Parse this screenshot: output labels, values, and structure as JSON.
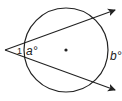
{
  "diagram": {
    "type": "secant-angle-circle",
    "labels": {
      "angle_inner_arc": "a°",
      "angle_outer_arc": "b°",
      "angle_mark": "1"
    },
    "colors": {
      "stroke": "#222222",
      "background": "#ffffff"
    }
  }
}
